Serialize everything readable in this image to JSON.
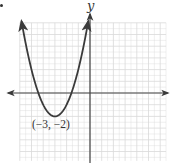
{
  "chart_data": {
    "type": "line",
    "title": "",
    "xlabel": "",
    "ylabel": "y",
    "xlim": [
      -6,
      6.5
    ],
    "ylim": [
      -5.8,
      6
    ],
    "grid": true,
    "grid_step": 1,
    "legend": null,
    "series": [
      {
        "name": "parabola",
        "equation": "y = (x + 3)^2 - 2",
        "x": [
          -5.85,
          -5.5,
          -5,
          -4.5,
          -4.41,
          -4,
          -3.5,
          -3,
          -2.5,
          -2,
          -1.59,
          -1.5,
          -1,
          -0.5,
          -0.15
        ],
        "y": [
          6.12,
          4.25,
          2,
          0.25,
          0,
          -1,
          -1.75,
          -2,
          -1.75,
          -1,
          0,
          0.25,
          2,
          4.25,
          6.12
        ],
        "arrows_at_ends": true
      }
    ],
    "annotations": [
      {
        "text": "(−3, −2)",
        "x": -3,
        "y": -2,
        "position": "below"
      }
    ],
    "key_points": {
      "vertex": [
        -3,
        -2
      ],
      "x_intercepts": [
        -4.41,
        -1.59
      ],
      "axis_of_symmetry": -3
    },
    "colors": {
      "curve": "#3a3a3a",
      "axes": "#444444",
      "grid": "#d9d9d9"
    }
  },
  "labels": {
    "y_axis": "y",
    "vertex": "(−3, −2)"
  }
}
